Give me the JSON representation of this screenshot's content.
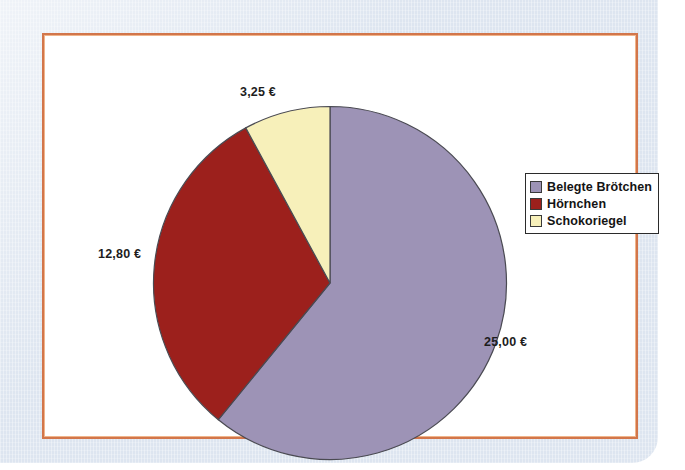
{
  "figure": {
    "background_color": "#dde5f0",
    "plot_background_color": "#ffffff",
    "frame_color": "#d2764b"
  },
  "legend": {
    "position": "right",
    "border_color": "#2b2b2b",
    "items": [
      {
        "label": "Belegte Brötchen",
        "color": "#9d93b6"
      },
      {
        "label": "Hörnchen",
        "color": "#9c201c"
      },
      {
        "label": "Schokoriegel",
        "color": "#f7f0ba"
      }
    ]
  },
  "labels": {
    "schokoriegel": "3,25 €",
    "hoernchen": "12,80 €",
    "broetchen": "25,00 €"
  },
  "chart_data": {
    "type": "pie",
    "title": "",
    "subtitle": "",
    "xlabel": "",
    "ylabel": "",
    "grid": false,
    "legend_position": "right",
    "start_angle_deg": 0,
    "direction": "clockwise",
    "categories": [
      "Belegte Brötchen",
      "Hörnchen",
      "Schokoriegel"
    ],
    "values": [
      25.0,
      12.8,
      3.25
    ],
    "value_labels": [
      "25,00 €",
      "12,80 €",
      "3,25 €"
    ],
    "colors": [
      "#9d93b6",
      "#9c201c",
      "#f7f0ba"
    ],
    "units": "EUR",
    "total": 41.05,
    "percentages": [
      60.9,
      31.2,
      7.9
    ],
    "slice_angles_deg": [
      219.2,
      112.3,
      28.5
    ]
  }
}
